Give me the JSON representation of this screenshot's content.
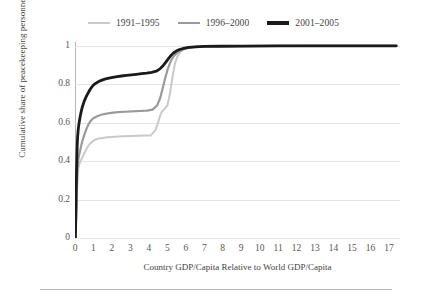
{
  "chart_data": {
    "type": "line",
    "title": "",
    "xlabel": "Country GDP/Capita Relative to World GDP/Capita",
    "ylabel": "Cumulative share of peacekeeping personnel",
    "xlim": [
      0,
      17.6
    ],
    "ylim": [
      0,
      1.02
    ],
    "xticks": [
      "0",
      "1",
      "2",
      "3",
      "4",
      "5",
      "6",
      "7",
      "8",
      "9",
      "10",
      "11",
      "12",
      "13",
      "14",
      "15",
      "16",
      "17"
    ],
    "yticks": [
      "0",
      "0.2",
      "0.4",
      "0.6",
      "0.8",
      "1"
    ],
    "grid": "horizontal",
    "legend_position": "top-center",
    "series": [
      {
        "name": "1991–1995",
        "color": "#c9c9c9",
        "width": 2.0,
        "points": [
          [
            0.02,
            0.0
          ],
          [
            0.05,
            0.06
          ],
          [
            0.08,
            0.13
          ],
          [
            0.1,
            0.2
          ],
          [
            0.12,
            0.27
          ],
          [
            0.15,
            0.33
          ],
          [
            0.18,
            0.36
          ],
          [
            0.22,
            0.38
          ],
          [
            0.28,
            0.395
          ],
          [
            0.35,
            0.41
          ],
          [
            0.42,
            0.425
          ],
          [
            0.5,
            0.44
          ],
          [
            0.58,
            0.455
          ],
          [
            0.66,
            0.47
          ],
          [
            0.74,
            0.482
          ],
          [
            0.82,
            0.492
          ],
          [
            0.92,
            0.5
          ],
          [
            1.02,
            0.508
          ],
          [
            1.15,
            0.514
          ],
          [
            1.3,
            0.518
          ],
          [
            1.5,
            0.521
          ],
          [
            1.75,
            0.524
          ],
          [
            2.0,
            0.526
          ],
          [
            2.3,
            0.528
          ],
          [
            2.6,
            0.53
          ],
          [
            3.0,
            0.531
          ],
          [
            3.4,
            0.532
          ],
          [
            3.8,
            0.533
          ],
          [
            4.1,
            0.534
          ],
          [
            4.35,
            0.56
          ],
          [
            4.5,
            0.6
          ],
          [
            4.62,
            0.64
          ],
          [
            4.72,
            0.66
          ],
          [
            4.85,
            0.672
          ],
          [
            5.0,
            0.69
          ],
          [
            5.12,
            0.74
          ],
          [
            5.22,
            0.8
          ],
          [
            5.32,
            0.86
          ],
          [
            5.42,
            0.91
          ],
          [
            5.55,
            0.945
          ],
          [
            5.7,
            0.968
          ],
          [
            5.9,
            0.982
          ],
          [
            6.15,
            0.99
          ],
          [
            6.5,
            0.995
          ],
          [
            7.0,
            0.997
          ],
          [
            8.0,
            0.998
          ],
          [
            10.0,
            0.999
          ],
          [
            13.0,
            1.0
          ],
          [
            17.4,
            1.0
          ]
        ]
      },
      {
        "name": "1996–2000",
        "color": "#9a9a9a",
        "width": 2.2,
        "points": [
          [
            0.02,
            0.0
          ],
          [
            0.05,
            0.08
          ],
          [
            0.08,
            0.17
          ],
          [
            0.1,
            0.26
          ],
          [
            0.12,
            0.33
          ],
          [
            0.15,
            0.38
          ],
          [
            0.18,
            0.41
          ],
          [
            0.22,
            0.43
          ],
          [
            0.27,
            0.452
          ],
          [
            0.33,
            0.478
          ],
          [
            0.4,
            0.505
          ],
          [
            0.48,
            0.53
          ],
          [
            0.56,
            0.552
          ],
          [
            0.64,
            0.572
          ],
          [
            0.72,
            0.59
          ],
          [
            0.82,
            0.605
          ],
          [
            0.92,
            0.617
          ],
          [
            1.05,
            0.626
          ],
          [
            1.2,
            0.634
          ],
          [
            1.38,
            0.64
          ],
          [
            1.58,
            0.645
          ],
          [
            1.8,
            0.649
          ],
          [
            2.05,
            0.652
          ],
          [
            2.35,
            0.655
          ],
          [
            2.7,
            0.657
          ],
          [
            3.1,
            0.659
          ],
          [
            3.5,
            0.661
          ],
          [
            3.9,
            0.663
          ],
          [
            4.2,
            0.668
          ],
          [
            4.45,
            0.69
          ],
          [
            4.62,
            0.73
          ],
          [
            4.75,
            0.78
          ],
          [
            4.88,
            0.83
          ],
          [
            5.0,
            0.872
          ],
          [
            5.12,
            0.905
          ],
          [
            5.25,
            0.932
          ],
          [
            5.4,
            0.952
          ],
          [
            5.58,
            0.968
          ],
          [
            5.8,
            0.98
          ],
          [
            6.05,
            0.988
          ],
          [
            6.4,
            0.993
          ],
          [
            6.9,
            0.996
          ],
          [
            7.6,
            0.998
          ],
          [
            9.0,
            0.999
          ],
          [
            11.5,
            1.0
          ],
          [
            17.4,
            1.0
          ]
        ]
      },
      {
        "name": "2001–2005",
        "color": "#1a1a1a",
        "width": 2.8,
        "points": [
          [
            0.02,
            0.0
          ],
          [
            0.04,
            0.1
          ],
          [
            0.06,
            0.22
          ],
          [
            0.08,
            0.33
          ],
          [
            0.1,
            0.42
          ],
          [
            0.12,
            0.48
          ],
          [
            0.14,
            0.525
          ],
          [
            0.17,
            0.56
          ],
          [
            0.2,
            0.585
          ],
          [
            0.24,
            0.61
          ],
          [
            0.28,
            0.632
          ],
          [
            0.33,
            0.655
          ],
          [
            0.38,
            0.676
          ],
          [
            0.44,
            0.695
          ],
          [
            0.5,
            0.712
          ],
          [
            0.57,
            0.728
          ],
          [
            0.64,
            0.742
          ],
          [
            0.72,
            0.756
          ],
          [
            0.8,
            0.77
          ],
          [
            0.88,
            0.782
          ],
          [
            0.96,
            0.792
          ],
          [
            1.05,
            0.8
          ],
          [
            1.14,
            0.806
          ],
          [
            1.24,
            0.812
          ],
          [
            1.36,
            0.818
          ],
          [
            1.5,
            0.823
          ],
          [
            1.66,
            0.828
          ],
          [
            1.84,
            0.832
          ],
          [
            2.05,
            0.836
          ],
          [
            2.28,
            0.84
          ],
          [
            2.52,
            0.843
          ],
          [
            2.78,
            0.846
          ],
          [
            3.05,
            0.849
          ],
          [
            3.32,
            0.852
          ],
          [
            3.6,
            0.855
          ],
          [
            3.88,
            0.858
          ],
          [
            4.15,
            0.862
          ],
          [
            4.4,
            0.868
          ],
          [
            4.6,
            0.88
          ],
          [
            4.78,
            0.898
          ],
          [
            4.92,
            0.915
          ],
          [
            5.05,
            0.932
          ],
          [
            5.18,
            0.948
          ],
          [
            5.32,
            0.962
          ],
          [
            5.48,
            0.973
          ],
          [
            5.66,
            0.981
          ],
          [
            5.88,
            0.987
          ],
          [
            6.15,
            0.992
          ],
          [
            6.5,
            0.995
          ],
          [
            7.0,
            0.997
          ],
          [
            7.8,
            0.998
          ],
          [
            9.0,
            0.999
          ],
          [
            11.0,
            1.0
          ],
          [
            17.4,
            1.0
          ]
        ]
      }
    ]
  },
  "legend": {
    "items": [
      {
        "label": "1991–1995",
        "color": "#c9c9c9",
        "thickness": "2px"
      },
      {
        "label": "1996–2000",
        "color": "#9a9a9a",
        "thickness": "2.5px"
      },
      {
        "label": "2001–2005",
        "color": "#1a1a1a",
        "thickness": "3.5px"
      }
    ]
  }
}
